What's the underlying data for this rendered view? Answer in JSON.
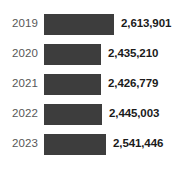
{
  "chart_data": {
    "type": "bar",
    "orientation": "horizontal",
    "title": "",
    "subtitle": "",
    "xlabel": "",
    "ylabel": "",
    "grid": false,
    "legend": null,
    "axis_visible": false,
    "categories": [
      "2019",
      "2020",
      "2021",
      "2022",
      "2023"
    ],
    "values": [
      2613901,
      2435210,
      2426779,
      2445003,
      2541446
    ],
    "value_labels": [
      "2,613,901",
      "2,435,210",
      "2,426,779",
      "2,445,003",
      "2,541,446"
    ],
    "bar_color": "#3d3d3d",
    "category_label_color": "#585858",
    "value_label_color": "#1b1b1b",
    "background_color": "#ffffff",
    "bars": [
      {
        "category": "2019",
        "value": 2613901,
        "value_label": "2,613,901",
        "bar_width_px": 70
      },
      {
        "category": "2020",
        "value": 2435210,
        "value_label": "2,435,210",
        "bar_width_px": 57
      },
      {
        "category": "2021",
        "value": 2426779,
        "value_label": "2,426,779",
        "bar_width_px": 57
      },
      {
        "category": "2022",
        "value": 2445003,
        "value_label": "2,445,003",
        "bar_width_px": 58
      },
      {
        "category": "2023",
        "value": 2541446,
        "value_label": "2,541,446",
        "bar_width_px": 62
      }
    ]
  }
}
